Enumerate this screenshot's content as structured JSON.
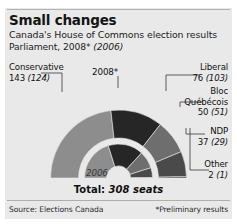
{
  "card": {
    "title": "Small changes",
    "subtitle": "Canada's House of Commons election results",
    "parliament_prefix": "Parliament, 2008*",
    "parliament_old": "(2006)",
    "total": "Total:",
    "total_seats": "308 seats",
    "source": "Source: Elections Canada",
    "footnote": "*Preliminary results",
    "background": "#e9e9e9"
  },
  "chart_labels": {
    "outer_ring": "2008*",
    "inner_ring": "2006"
  },
  "chart_data": {
    "type": "pie",
    "title": "Canada's House of Commons election results",
    "subtitle": "Parliament, 2008* (2006)",
    "shape": "nested-semicircle-donut",
    "total_2008": 308,
    "total_2006": 308,
    "legend_position": "leader-lines",
    "categories": [
      "Conservative",
      "Liberal",
      "Bloc Quebecois",
      "NDP",
      "Other"
    ],
    "series": [
      {
        "name": "2008*",
        "ring": "outer",
        "values": [
          143,
          76,
          50,
          37,
          2
        ]
      },
      {
        "name": "2006",
        "ring": "inner",
        "values": [
          124,
          103,
          51,
          29,
          1
        ]
      }
    ],
    "colors": [
      "#8d8d8d",
      "#262626",
      "#6e6e6e",
      "#4a4a4a",
      "#333333"
    ],
    "labels": [
      {
        "party": "Conservative",
        "value": "143",
        "prev": "(124)",
        "color": "#8d8d8d",
        "side": "left"
      },
      {
        "party": "Liberal",
        "value": "76",
        "prev": "(103)",
        "color": "#262626",
        "side": "right"
      },
      {
        "party": "Bloc",
        "party2": "Québécois",
        "value": "50",
        "prev": "(51)",
        "color": "#6e6e6e",
        "side": "right"
      },
      {
        "party": "NDP",
        "value": "37",
        "prev": "(29)",
        "color": "#4a4a4a",
        "side": "right"
      },
      {
        "party": "Other",
        "value": "2",
        "prev": "(1)",
        "color": "#333333",
        "side": "right"
      }
    ]
  }
}
